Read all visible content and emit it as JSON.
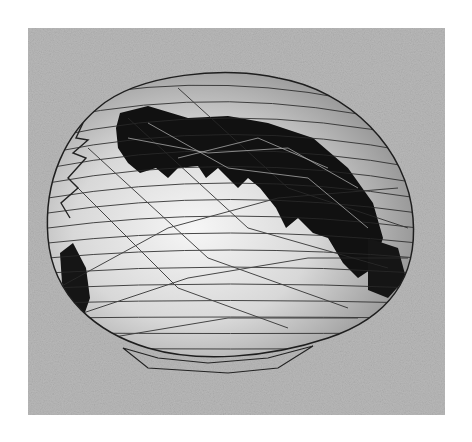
{
  "figure": {
    "colors": {
      "page_background": "#ffffff",
      "panel_background": "#b9b9b9",
      "mesh_fill": "#e2e2e2",
      "highlight": "#f4f4f4",
      "dark_patch": "#111111",
      "wire": "#2a2a2a"
    }
  }
}
